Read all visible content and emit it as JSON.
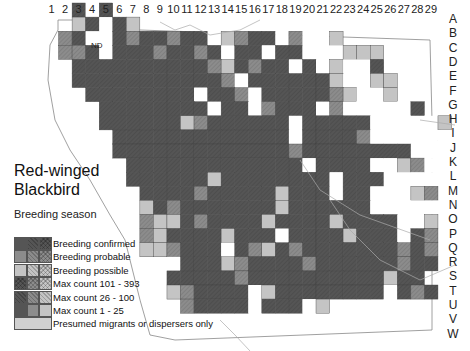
{
  "title": {
    "line1": "Red-winged",
    "line2": "Blackbird"
  },
  "subtitle": "Breeding season",
  "column_labels": [
    "1",
    "2",
    "3",
    "4",
    "5",
    "6",
    "7",
    "8",
    "9",
    "10",
    "11",
    "12",
    "13",
    "14",
    "15",
    "16",
    "17",
    "18",
    "19",
    "20",
    "21",
    "22",
    "23",
    "24",
    "25",
    "26",
    "27",
    "28",
    "29"
  ],
  "row_labels": [
    "A",
    "B",
    "C",
    "D",
    "E",
    "F",
    "G",
    "H",
    "I",
    "J",
    "K",
    "L",
    "M",
    "N",
    "O",
    "P",
    "Q",
    "R",
    "S",
    "T",
    "U",
    "V",
    "W"
  ],
  "nd_label": "ND",
  "colors": {
    "confirmed": "#555555",
    "probable": "#8c8c8c",
    "possible": "#c4c4c4",
    "migrant": "#d0d0d0",
    "empty": "#ffffff",
    "land": "#ffffff",
    "outline": "#888888",
    "road": "#aaaaaa"
  },
  "legend": {
    "items": [
      {
        "label": "Breeding confirmed",
        "swatches": [
          "#555555",
          "#555555",
          "#555555"
        ],
        "hatch": [
          "none",
          "diag",
          "cross"
        ]
      },
      {
        "label": "Breeding probable",
        "swatches": [
          "#8c8c8c",
          "#8c8c8c",
          "#8c8c8c"
        ],
        "hatch": [
          "none",
          "diag",
          "cross"
        ]
      },
      {
        "label": "Breeding possible",
        "swatches": [
          "#c4c4c4",
          "#c4c4c4",
          "#c4c4c4"
        ],
        "hatch": [
          "none",
          "diag",
          "cross"
        ]
      },
      {
        "label": "Max count 101 - 393",
        "swatches": [
          "#555555",
          "#8c8c8c",
          "#c4c4c4"
        ],
        "hatch": [
          "cross",
          "cross",
          "cross"
        ]
      },
      {
        "label": "Max count 26 - 100",
        "swatches": [
          "#555555",
          "#8c8c8c",
          "#c4c4c4"
        ],
        "hatch": [
          "diag",
          "diag",
          "diag"
        ]
      },
      {
        "label": "Max count 1 - 25",
        "swatches": [
          "#555555",
          "#8c8c8c",
          "#c4c4c4"
        ],
        "hatch": [
          "none",
          "none",
          "none"
        ]
      },
      {
        "label": "Presumed migrants or dispersers only",
        "swatches": [
          "#d0d0d0"
        ],
        "hatch": [
          "none"
        ]
      }
    ]
  },
  "chart_data": {
    "type": "heatmap",
    "title": "Red-winged Blackbird",
    "subtitle": "Breeding season",
    "x_labels": [
      "1",
      "2",
      "3",
      "4",
      "5",
      "6",
      "7",
      "8",
      "9",
      "10",
      "11",
      "12",
      "13",
      "14",
      "15",
      "16",
      "17",
      "18",
      "19",
      "20",
      "21",
      "22",
      "23",
      "24",
      "25",
      "26",
      "27",
      "28",
      "29"
    ],
    "y_labels": [
      "A",
      "B",
      "C",
      "D",
      "E",
      "F",
      "G",
      "H",
      "I",
      "J",
      "K",
      "L",
      "M",
      "N",
      "O",
      "P",
      "Q",
      "R",
      "S",
      "T",
      "U",
      "V",
      "W"
    ],
    "legend": [
      "Breeding confirmed",
      "Breeding probable",
      "Breeding possible",
      "Max count 101 - 393",
      "Max count 26 - 100",
      "Max count 1 - 25",
      "Presumed migrants or dispersers only"
    ],
    "encoding": "C=confirmed, P=probable, S=possible, M=migrant, .=not recorded, space=outside county; N=ND (no data)",
    "grid": [
      "  C.C                        ",
      "  SC.CS                      ",
      " PCN.CPCCPCC.SPCC.P..S       ",
      " PPC.CCCPCCPC.CC.CC...SSS    ",
      "  CCCCCCCCCCPSCPCC.C.S..C    ",
      "  CCCCCCCCCCCP.CCCCCCS..SS   ",
      "   CCCCCCCC.CCP.CCCCCPS..S   ",
      "    CCCCCCCC.CC.PCCC.P.....C  ",
      "    CCCCCCSPCCCCCC.CCCCC.....S",
      "     CCCCCCCCCCCCC.CCCCP......",
      "     CCCCCCCCCCCCCPCCCCCCCC....",
      "      CCCCCCCCCCCCC.CCCC..SP..",
      "      CCCCCCSCCCCCCCC.CCC.....",
      "       CCCCPCCCCCSCCC.CC...SP",
      "       SCPCCCCCCCSCCCCCC.....",
      "       PSSCPCCCCSCCCCSCCCC..S",
      "       PSCCCCSCCC.CCCCSCCC.CP",
      "       SSPCCC.CPSCPCCCCCCCPCP",
      "         .CCCSPCCCCPCCCCCCPCC",
      "         CCCCCPCCCCCCCCCCSCC",
      "         SPCCCC.SCCCCCCCC.CPC",
      "          PCCCC.CCC.S       ",
      "                            "
    ]
  }
}
